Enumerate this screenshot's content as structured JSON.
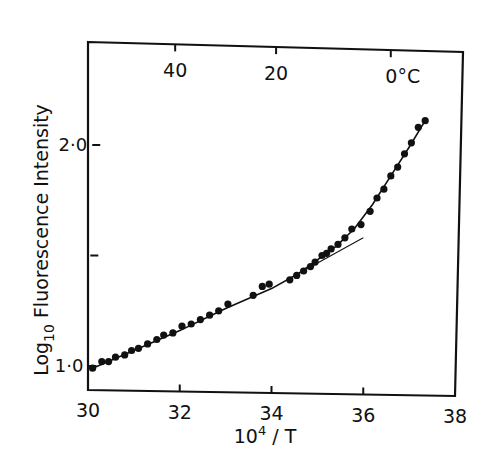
{
  "chart_data": {
    "type": "scatter",
    "title": "",
    "xlabel": "10^4 / T",
    "xlabel_parts": {
      "base": "10",
      "exp": "4",
      "rest": " / T"
    },
    "ylabel": "Log10 Fluorescence Intensity",
    "ylabel_parts": {
      "pre": "Log",
      "sub": "10",
      "post": "  Fluorescence Intensity"
    },
    "xlim": [
      30,
      38
    ],
    "ylim": [
      0.9,
      2.2
    ],
    "x_ticks": [
      30,
      32,
      34,
      36,
      38
    ],
    "x_tick_labels": [
      "30",
      "32",
      "34",
      "36",
      "38"
    ],
    "y_ticks": [
      1.0,
      1.5,
      2.0
    ],
    "y_tick_labels": [
      "1·0",
      "",
      "2·0"
    ],
    "top_axis": {
      "label": "Temperature (°C)",
      "ticks": [
        {
          "x": 31.9,
          "label": "40"
        },
        {
          "x": 34.1,
          "label": "20"
        },
        {
          "x": 36.6,
          "label": "0°C"
        }
      ]
    },
    "grid": false,
    "legend": null,
    "series": [
      {
        "name": "measured points",
        "type": "scatter",
        "x": [
          30.1,
          30.3,
          30.45,
          30.6,
          30.8,
          30.95,
          31.1,
          31.3,
          31.5,
          31.65,
          31.85,
          32.05,
          32.25,
          32.45,
          32.65,
          32.85,
          33.05,
          33.6,
          33.8,
          33.95,
          34.4,
          34.55,
          34.7,
          34.85,
          34.95,
          35.1,
          35.2,
          35.3,
          35.45,
          35.6,
          35.75,
          35.95,
          36.15,
          36.3,
          36.45,
          36.6,
          36.75,
          36.9,
          37.05,
          37.2,
          37.35
        ],
        "y": [
          0.99,
          1.02,
          1.02,
          1.04,
          1.05,
          1.07,
          1.08,
          1.1,
          1.12,
          1.14,
          1.15,
          1.18,
          1.19,
          1.21,
          1.23,
          1.25,
          1.28,
          1.32,
          1.36,
          1.37,
          1.39,
          1.41,
          1.43,
          1.45,
          1.47,
          1.5,
          1.51,
          1.53,
          1.55,
          1.58,
          1.62,
          1.64,
          1.7,
          1.76,
          1.8,
          1.86,
          1.9,
          1.96,
          2.01,
          2.08,
          2.11
        ]
      },
      {
        "name": "fitted curve",
        "type": "line",
        "x": [
          30.1,
          31,
          32,
          33,
          34,
          34.6,
          35,
          35.4,
          35.8,
          36.2,
          36.6,
          37.0,
          37.35
        ],
        "y": [
          0.99,
          1.07,
          1.16,
          1.26,
          1.35,
          1.42,
          1.48,
          1.54,
          1.62,
          1.73,
          1.86,
          1.99,
          2.11
        ]
      },
      {
        "name": "extrapolated linear fit",
        "type": "line",
        "x": [
          34.6,
          36.0
        ],
        "y": [
          1.42,
          1.58
        ]
      }
    ]
  }
}
